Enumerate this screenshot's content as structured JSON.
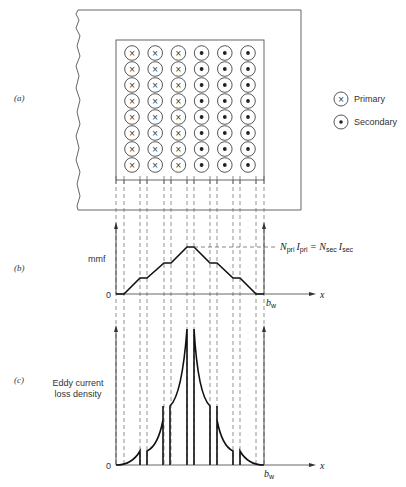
{
  "panels": {
    "a": {
      "label": "(a)"
    },
    "b": {
      "label": "(b)"
    },
    "c": {
      "label": "(c)"
    }
  },
  "legend": {
    "primary": {
      "symbol": "×",
      "label": "Primary"
    },
    "secondary": {
      "symbol": "•",
      "label": "Secondary"
    }
  },
  "winding": {
    "columns": [
      {
        "type": "primary"
      },
      {
        "type": "primary"
      },
      {
        "type": "primary"
      },
      {
        "type": "secondary"
      },
      {
        "type": "secondary"
      },
      {
        "type": "secondary"
      }
    ],
    "rows": 8
  },
  "mmf_plot": {
    "ylabel": "mmf",
    "zero_label": "0",
    "xlabel": "x",
    "end_label": "b",
    "end_sub": "w",
    "annotation": {
      "n1": "N",
      "n1_sub": "pri",
      "i1": "I",
      "i1_sub": "pri",
      "eq": "=",
      "n2": "N",
      "n2_sub": "sec",
      "i2": "I",
      "i2_sub": "sec"
    }
  },
  "eddy_plot": {
    "ylabel_line1": "Eddy current",
    "ylabel_line2": "loss density",
    "zero_label": "0",
    "xlabel": "x",
    "end_label": "b",
    "end_sub": "w"
  },
  "chart_data": [
    {
      "type": "line",
      "title": "mmf distribution across winding window",
      "xlabel": "x",
      "ylabel": "mmf",
      "x_end_label": "b_w",
      "x": [
        0,
        1,
        2,
        3,
        4,
        5,
        6,
        7,
        8,
        9,
        10,
        11,
        12,
        13
      ],
      "values": [
        0,
        0,
        1,
        1,
        2,
        2,
        3,
        3,
        2,
        2,
        1,
        1,
        0,
        0
      ],
      "annotation": "N_pri I_pri = N_sec I_sec (peak)"
    },
    {
      "type": "line",
      "title": "Eddy current loss density across winding window",
      "xlabel": "x",
      "ylabel": "Eddy current loss density",
      "x_end_label": "b_w",
      "note": "Quadratic-like rise within each layer; peaks at primary/secondary interface",
      "layer_peaks_relative": [
        0.1,
        0.33,
        1.0,
        0.33,
        0.1
      ]
    }
  ]
}
